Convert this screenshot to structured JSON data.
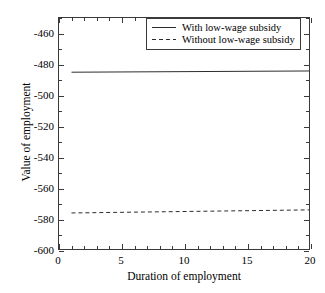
{
  "chart_data": {
    "type": "line",
    "title": "",
    "xlabel": "Duration of employment",
    "ylabel": "Value of employment",
    "xlim": [
      0,
      20
    ],
    "ylim": [
      -600,
      -450
    ],
    "xticks": [
      0,
      5,
      10,
      15,
      20
    ],
    "xtick_labels": [
      "0",
      "5",
      "10",
      "15",
      "20"
    ],
    "yticks": [
      -460,
      -480,
      -500,
      -520,
      -540,
      -560,
      -580,
      -600
    ],
    "ytick_labels": [
      "-460",
      "-480",
      "-500",
      "-520",
      "-540",
      "-560",
      "-580",
      "-600"
    ],
    "grid": false,
    "legend_position": "top-right",
    "x": [
      1,
      20
    ],
    "series": [
      {
        "name": "With low-wage subsidy",
        "style": "solid",
        "color": "#2b2b2b",
        "values": [
          -485.2,
          -484.4
        ]
      },
      {
        "name": "Without low-wage subsidy",
        "style": "dashed",
        "color": "#2b2b2b",
        "values": [
          -576.6,
          -574.6
        ]
      }
    ]
  },
  "legend": {
    "entries": [
      {
        "label": "With low-wage subsidy",
        "style": "solid"
      },
      {
        "label": "Without low-wage subsidy",
        "style": "dashed"
      }
    ]
  },
  "axes": {
    "x_title": "Duration of employment",
    "y_title": "Value of employment"
  }
}
